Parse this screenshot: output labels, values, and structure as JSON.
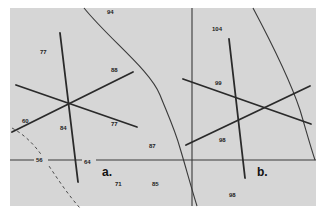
{
  "figure": {
    "background_color": "#d6d6d6",
    "line_color": "#2a2a2a",
    "panels": [
      {
        "label": "a."
      },
      {
        "label": "b."
      }
    ],
    "values": {
      "v94": "94",
      "v77": "77",
      "v88": "88",
      "v60": "60",
      "v84": "84",
      "v77b": "77",
      "v56": "56",
      "v64": "64",
      "v87": "87",
      "v71": "71",
      "v85": "85",
      "v104": "104",
      "v99": "99",
      "v98": "98",
      "v98b": "98"
    }
  }
}
